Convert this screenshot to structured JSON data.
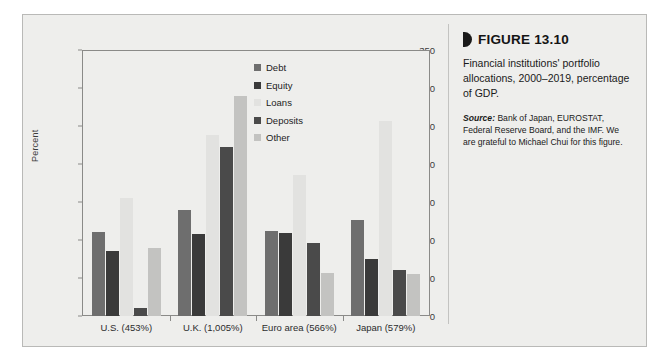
{
  "figure": {
    "marker_icon": "figure-bullet-icon",
    "title": "FIGURE 13.10",
    "description": "Financial institutions' portfolio allocations, 2000–2019, percentage of GDP.",
    "source_lead": "Source:",
    "source_text": " Bank of Japan, EUROSTAT, Federal Reserve Board, and the IMF. We are grateful to Michael Chui for this figure."
  },
  "colors": {
    "debt": "#6e6e6e",
    "equity": "#3a3a3a",
    "loans": "#e2e2e0",
    "deposits": "#4a4a4a",
    "other": "#c3c3c1",
    "axis": "#8a8a88",
    "panel_background": "#eeeeec",
    "text": "#1c1c1c"
  },
  "chart_data": {
    "type": "bar",
    "title": "Financial institutions' portfolio allocations, 2000–2019, percentage of GDP.",
    "xlabel": "",
    "ylabel": "Percent",
    "ylim": [
      0,
      350
    ],
    "yticks": [
      0,
      50,
      100,
      150,
      200,
      250,
      300,
      350
    ],
    "ytick_labels": [
      "0",
      "50",
      "100",
      "150",
      "200",
      "250",
      "300",
      "350"
    ],
    "grid": false,
    "legend_position": "inside-top-center",
    "categories": [
      "U.S. (453%)",
      "U.K. (1,005%)",
      "Euro area (566%)",
      "Japan (579%)"
    ],
    "series": [
      {
        "name": "Debt",
        "color": "#6e6e6e",
        "values": [
          110,
          140,
          112,
          126
        ]
      },
      {
        "name": "Equity",
        "color": "#3a3a3a",
        "values": [
          85,
          108,
          109,
          75
        ]
      },
      {
        "name": "Loans",
        "color": "#e2e2e0",
        "values": [
          155,
          238,
          185,
          256
        ]
      },
      {
        "name": "Deposits",
        "color": "#4a4a4a",
        "values": [
          10,
          222,
          96,
          60
        ]
      },
      {
        "name": "Other",
        "color": "#c3c3c1",
        "values": [
          90,
          290,
          57,
          55
        ]
      }
    ]
  }
}
